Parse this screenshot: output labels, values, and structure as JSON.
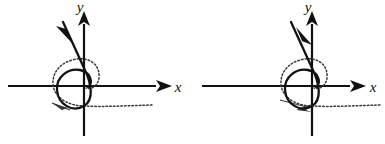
{
  "figure": {
    "background_color": "#ffffff",
    "stroke_color": "#111111",
    "dotted_color": "#3a3a3a",
    "width": 385,
    "height": 144
  },
  "panels": [
    {
      "id": "left",
      "name": "stable-spiral-phase-portrait",
      "axes": {
        "x_label": "x",
        "y_label": "y",
        "x_axis_name": "horizontal-axis",
        "y_axis_name": "vertical-axis",
        "origin_x": 84,
        "origin_y": 86,
        "x_axis_start": 8,
        "x_axis_end": 170,
        "y_axis_top": 13,
        "y_axis_bottom": 136
      },
      "trajectory": {
        "style": "solid",
        "direction": "inward",
        "arrow_name": "trajectory-arrow-inward",
        "arrow_angle_deg": 56,
        "description": "solid spiral converging to origin"
      },
      "companion": {
        "style": "dotted",
        "direction": "inward",
        "arrow_name": "dotted-trajectory-arrow",
        "description": "dotted spiral with horizontal dotted tail to the right"
      }
    },
    {
      "id": "right",
      "name": "unstable-spiral-phase-portrait",
      "axes": {
        "x_label": "x",
        "y_label": "y",
        "x_axis_name": "horizontal-axis",
        "y_axis_name": "vertical-axis",
        "origin_x": 120,
        "origin_y": 86,
        "x_axis_start": 10,
        "x_axis_end": 172,
        "y_axis_top": 13,
        "y_axis_bottom": 136
      },
      "trajectory": {
        "style": "solid",
        "direction": "outward",
        "arrow_name": "trajectory-arrow-outward",
        "arrow_angle_deg": 236,
        "description": "solid spiral diverging from origin"
      },
      "companion": {
        "style": "dotted",
        "direction": "outward",
        "arrow_name": "dotted-trajectory-arrow",
        "description": "dotted spiral with horizontal dotted tail to the right"
      }
    }
  ]
}
